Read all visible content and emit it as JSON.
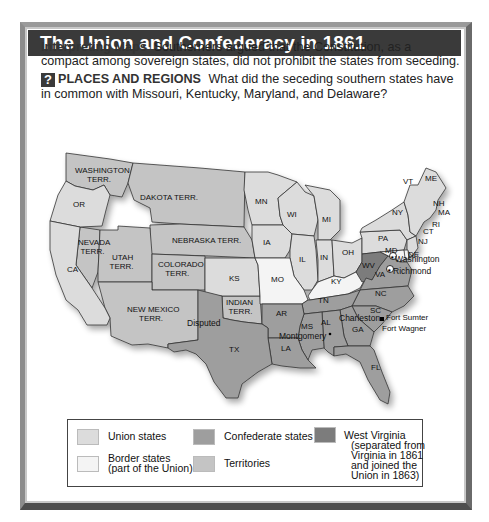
{
  "title": "The Union and Confederacy in 1861",
  "caption": {
    "heading": "Interpreting Maps",
    "text": "Southerners argued that the Constitution, as a compact among sovereign states, did not prohibit the states from seceding."
  },
  "question": {
    "badge": "?",
    "heading": "PLACES AND REGIONS",
    "text": "What did the seceding southern states have in common with Missouri, Kentucky, Maryland, and Delaware?"
  },
  "colors": {
    "union": "#dcdcdc",
    "border": "#f4f4f4",
    "confederate": "#9e9e9e",
    "territory": "#c4c4c4",
    "west_virginia": "#7c7c7c",
    "title_bar": "#3a3a3a"
  },
  "map": {
    "regions": {
      "washington_terr": "WASHINGTON TERR.",
      "oregon": "OR",
      "california": "CA",
      "nevada_terr": "NEVADA TERR.",
      "utah_terr": "UTAH TERR.",
      "dakota_terr": "DAKOTA TERR.",
      "nebraska_terr": "NEBRASKA TERR.",
      "colorado_terr": "COLORADO TERR.",
      "new_mexico_terr": "NEW MEXICO TERR.",
      "indian_terr": "INDIAN TERR.",
      "kansas": "KS",
      "minnesota": "MN",
      "iowa": "IA",
      "missouri": "MO",
      "wisconsin": "WI",
      "michigan": "MI",
      "illinois": "IL",
      "indiana": "IN",
      "ohio": "OH",
      "kentucky": "KY",
      "west_virginia": "WV",
      "virginia": "VA",
      "pennsylvania": "PA",
      "new_york": "NY",
      "vermont": "VT",
      "maine": "ME",
      "new_hampshire": "NH",
      "massachusetts": "MA",
      "rhode_island": "RI",
      "connecticut": "CT",
      "new_jersey": "NJ",
      "delaware": "DE",
      "maryland": "MD",
      "texas": "TX",
      "arkansas": "AR",
      "louisiana": "LA",
      "mississippi": "MS",
      "alabama": "AL",
      "tennessee": "TN",
      "georgia": "GA",
      "florida": "FL",
      "south_carolina": "SC",
      "north_carolina": "NC"
    },
    "places": {
      "disputed": "Disputed",
      "washington": "Washington",
      "richmond": "Richmond",
      "charleston": "Charleston",
      "montgomery": "Montgomery",
      "fort_sumter": "Fort Sumter",
      "fort_wagner": "Fort Wagner"
    }
  },
  "legend": {
    "items": [
      {
        "label": "Union states",
        "category": "union"
      },
      {
        "label": "Border states (part of the Union)",
        "line1": "Border states",
        "line2": "(part of the Union)",
        "category": "border"
      },
      {
        "label": "Confederate states",
        "category": "confederate"
      },
      {
        "label": "Territories",
        "category": "territory"
      },
      {
        "label": "West Virginia (separated from Virginia in 1861 and joined the Union in 1863)",
        "line1": "West Virginia",
        "line2": "(separated from",
        "line3": "Virginia in 1861",
        "line4": "and joined the",
        "line5": "Union in 1863)",
        "category": "west_virginia"
      }
    ]
  }
}
